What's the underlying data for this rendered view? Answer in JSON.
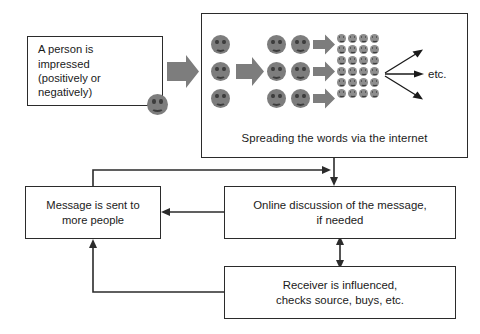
{
  "diagram": {
    "background_color": "#ffffff",
    "line_color": "#2b2b2b",
    "smiley_color": "#7d7d7d",
    "arrow_fill_color": "#7d7d7d"
  },
  "nodes": {
    "person": {
      "id": "person-box",
      "lines": [
        "A person is",
        "impressed",
        "(positively or",
        "negatively)"
      ],
      "text": "A person is impressed (positively or negatively)",
      "icon": "smiley-face-icon"
    },
    "spread_panel": {
      "id": "spread-panel",
      "caption": "Spreading the words via the internet",
      "etc_label": "etc.",
      "stage1_count": 3,
      "stage2_count": 6,
      "grid_columns": 4,
      "grid_rows": 6
    },
    "message": {
      "id": "msg-box",
      "lines": [
        "Message is sent to",
        "more people"
      ],
      "text": "Message is sent to more people"
    },
    "discussion": {
      "id": "discussion-box",
      "lines": [
        "Online discussion of the message,",
        "if needed"
      ],
      "text": "Online discussion of the message, if needed"
    },
    "receiver": {
      "id": "receiver-box",
      "lines": [
        "Receiver is influenced,",
        "checks source, buys, etc."
      ],
      "text": "Receiver is influenced, checks source, buys, etc."
    }
  },
  "connectors": [
    {
      "name": "person-to-spread",
      "from": "person",
      "to": "spread_panel",
      "style": "block-arrow",
      "direction": "right"
    },
    {
      "name": "spread-stage1-to-stage2",
      "from": "stage1",
      "to": "stage2",
      "style": "block-arrow",
      "direction": "right"
    },
    {
      "name": "spread-stage2-row1-to-grid",
      "from": "stage2",
      "to": "grid",
      "style": "block-arrow",
      "direction": "right"
    },
    {
      "name": "spread-stage2-row2-to-grid",
      "from": "stage2",
      "to": "grid",
      "style": "block-arrow",
      "direction": "right"
    },
    {
      "name": "spread-stage2-row3-to-grid",
      "from": "stage2",
      "to": "grid",
      "style": "block-arrow",
      "direction": "right"
    },
    {
      "name": "grid-to-etc-up",
      "from": "grid",
      "to": "etc",
      "style": "line-arrow",
      "direction": "up-right"
    },
    {
      "name": "grid-to-etc-straight",
      "from": "grid",
      "to": "etc",
      "style": "line-arrow",
      "direction": "right"
    },
    {
      "name": "grid-to-etc-down",
      "from": "grid",
      "to": "etc",
      "style": "line-arrow",
      "direction": "down-right"
    },
    {
      "name": "spread-to-discussion",
      "from": "spread_panel",
      "to": "discussion",
      "style": "line-arrow",
      "direction": "down"
    },
    {
      "name": "message-to-discussion",
      "from": "message",
      "to": "discussion",
      "style": "line-arrow",
      "direction": "right"
    },
    {
      "name": "discussion-to-message",
      "from": "discussion",
      "to": "message",
      "style": "line-arrow",
      "direction": "left"
    },
    {
      "name": "discussion-receiver-bidirectional",
      "from": "discussion",
      "to": "receiver",
      "style": "line-arrow",
      "direction": "both"
    },
    {
      "name": "receiver-to-message",
      "from": "receiver",
      "to": "message",
      "style": "line-arrow",
      "direction": "up"
    }
  ]
}
